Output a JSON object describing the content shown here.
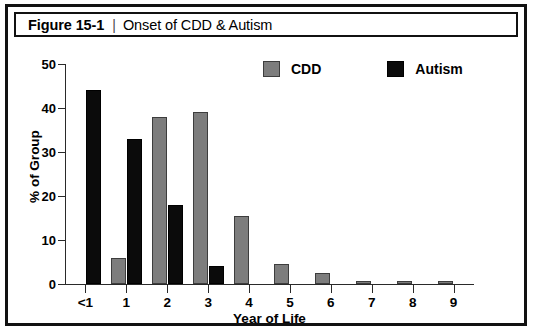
{
  "figure": {
    "number": "Figure 15-1",
    "separator": "|",
    "title": "Onset of CDD & Autism"
  },
  "chart_data": {
    "type": "bar",
    "title": "Onset of CDD & Autism",
    "xlabel": "Year of Life",
    "ylabel": "% of Group",
    "categories": [
      "<1",
      "1",
      "2",
      "3",
      "4",
      "5",
      "6",
      "7",
      "8",
      "9"
    ],
    "series": [
      {
        "name": "CDD",
        "color": "#7d7d7d",
        "values": [
          0,
          6,
          38,
          39,
          15.5,
          4.5,
          2.5,
          0.7,
          0.7,
          0.7
        ]
      },
      {
        "name": "Autism",
        "color": "#0b0b0b",
        "values": [
          44,
          33,
          18,
          4,
          0,
          0,
          0,
          0,
          0,
          0
        ]
      }
    ],
    "ylim": [
      0,
      50
    ],
    "yticks": [
      0,
      10,
      20,
      30,
      40,
      50
    ],
    "ytick_labels": [
      "0",
      "10",
      "20",
      "30",
      "40",
      "50"
    ],
    "grid": false,
    "legend_position": "top-center"
  }
}
